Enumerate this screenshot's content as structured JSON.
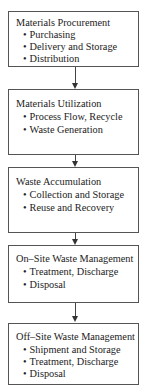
{
  "diagram": {
    "type": "flowchart",
    "direction": "top-to-bottom",
    "steps": [
      {
        "title": "Materials Procurement",
        "items": [
          "Purchasing",
          "Delivery and Storage",
          "Distribution"
        ]
      },
      {
        "title": "Materials Utilization",
        "items": [
          "Process Flow, Recycle",
          "Waste Generation"
        ]
      },
      {
        "title": "Waste Accumulation",
        "items": [
          "Collection and Storage",
          "Reuse and Recovery"
        ]
      },
      {
        "title": "On–Site Waste Management",
        "items": [
          "Treatment, Discharge",
          "Disposal"
        ]
      },
      {
        "title": "Off–Site Waste Management",
        "items": [
          "Shipment and Storage",
          "Treatment, Discharge",
          "Disposal"
        ]
      }
    ],
    "colors": {
      "border": "#555555",
      "arrow": "#333333",
      "text": "#222222",
      "background": "#ffffff"
    }
  }
}
